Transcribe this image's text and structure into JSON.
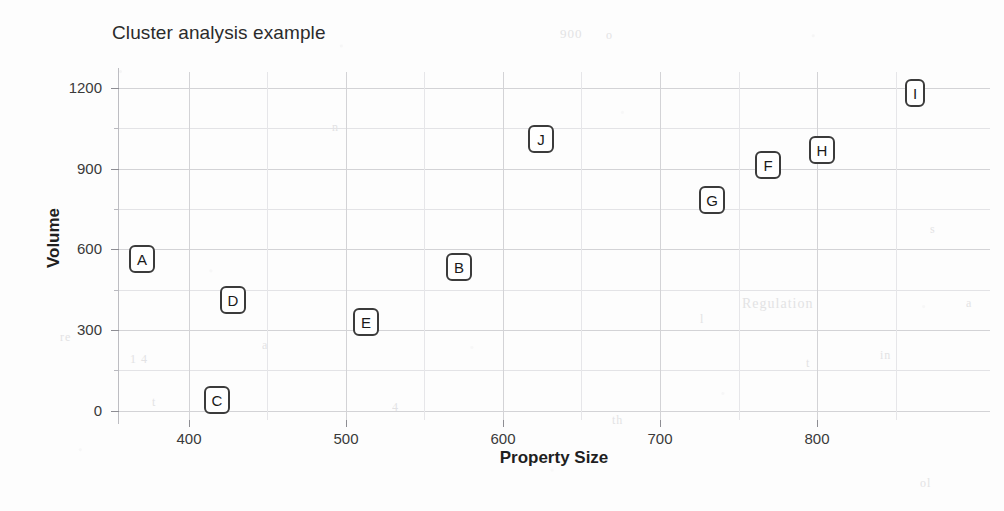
{
  "chart_data": {
    "type": "scatter",
    "title": "Cluster analysis example",
    "xlabel": "Property Size",
    "ylabel": "Volume",
    "xlim": [
      355,
      910
    ],
    "ylim": [
      -35,
      1260
    ],
    "grid": true,
    "legend": "none",
    "point_label_style": "boxed-letter",
    "x_ticks": [
      400,
      500,
      600,
      700,
      800
    ],
    "x_tick_labels": [
      "400",
      "500",
      "600",
      "700",
      "800"
    ],
    "y_ticks": [
      0,
      300,
      600,
      900,
      1200
    ],
    "y_tick_labels": [
      "0",
      "300",
      "600",
      "900",
      "1200"
    ],
    "y_minor_ticks": [
      150,
      450,
      750,
      1050
    ],
    "x_minor_ticks": [
      350,
      450,
      550,
      650,
      750,
      850
    ],
    "points": [
      {
        "label": "A",
        "x": 370,
        "y": 565
      },
      {
        "label": "B",
        "x": 572,
        "y": 535
      },
      {
        "label": "C",
        "x": 418,
        "y": 40
      },
      {
        "label": "D",
        "x": 428,
        "y": 410
      },
      {
        "label": "E",
        "x": 513,
        "y": 330
      },
      {
        "label": "F",
        "x": 769,
        "y": 915
      },
      {
        "label": "G",
        "x": 733,
        "y": 785
      },
      {
        "label": "H",
        "x": 803,
        "y": 970
      },
      {
        "label": "I",
        "x": 862,
        "y": 1180
      },
      {
        "label": "J",
        "x": 624,
        "y": 1010
      }
    ],
    "colors": {
      "marker_border": "#3b3b3b",
      "marker_fill": "#ffffff",
      "marker_text": "#1a1a1a",
      "grid_major": "#d3d3d6",
      "grid_minor": "#e6e6e9",
      "axis": "#bdbdc2",
      "tick_text": "#3a3a3a",
      "title_text": "#2b2b2b",
      "background": "#fdfdfd"
    }
  },
  "ghost_text": [
    {
      "text": "900",
      "x": 560,
      "y": 26,
      "size": 13
    },
    {
      "text": "o",
      "x": 606,
      "y": 28,
      "size": 12
    },
    {
      "text": "re",
      "x": 60,
      "y": 330,
      "size": 12
    },
    {
      "text": "1 4",
      "x": 130,
      "y": 352,
      "size": 12
    },
    {
      "text": "a",
      "x": 262,
      "y": 338,
      "size": 12
    },
    {
      "text": "n",
      "x": 332,
      "y": 120,
      "size": 12
    },
    {
      "text": "Regulation",
      "x": 742,
      "y": 296,
      "size": 14
    },
    {
      "text": "l",
      "x": 700,
      "y": 312,
      "size": 12
    },
    {
      "text": "t",
      "x": 806,
      "y": 356,
      "size": 12
    },
    {
      "text": "in",
      "x": 880,
      "y": 348,
      "size": 12
    },
    {
      "text": "t",
      "x": 152,
      "y": 395,
      "size": 12
    },
    {
      "text": "4",
      "x": 392,
      "y": 400,
      "size": 12
    },
    {
      "text": "th",
      "x": 612,
      "y": 413,
      "size": 12
    },
    {
      "text": "s",
      "x": 930,
      "y": 222,
      "size": 12
    },
    {
      "text": "a",
      "x": 966,
      "y": 296,
      "size": 12
    },
    {
      "text": "ol",
      "x": 920,
      "y": 476,
      "size": 12
    }
  ]
}
